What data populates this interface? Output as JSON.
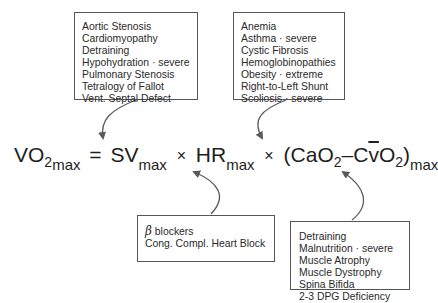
{
  "boxes": {
    "stroke_volume": {
      "items": [
        "Aortic Stenosis",
        "Cardiomyopathy",
        "Detraining",
        "Hypohydration · severe",
        "Pulmonary Stenosis",
        "Tetralogy of Fallot",
        "Vent. Septal Defect"
      ]
    },
    "arterial_o2": {
      "items": [
        "Anemia",
        "Asthma · severe",
        "Cystic Fibrosis",
        "Hemoglobinopathies",
        "Obesity · extreme",
        "Right-to-Left Shunt",
        "Scoliosis · severe"
      ]
    },
    "heart_rate": {
      "beta_symbol": "β",
      "items": [
        "blockers",
        "Cong. Compl. Heart Block"
      ]
    },
    "avo2_difference": {
      "items": [
        "Detraining",
        "Malnutrition · severe",
        "Muscle Atrophy",
        "Muscle Dystrophy",
        "Spina Bifida",
        "2-3 DPG Deficiency"
      ]
    }
  },
  "equation": {
    "vo2": "VO",
    "vo2_sub": "2",
    "vo2_max": "max",
    "equals": "=",
    "sv": "SV",
    "sv_max": "max",
    "times1": "×",
    "hr": "HR",
    "hr_max": "max",
    "times2": "×",
    "open_paren": "(CaO",
    "cao2_sub": "2",
    "minus": "–C",
    "v_bar": "v",
    "o": "O",
    "cvo2_sub": "2",
    "close_paren": ")",
    "diff_max": "max"
  },
  "colors": {
    "text": "#222222",
    "box_border": "#555555",
    "arrow": "#5a5a5a"
  }
}
